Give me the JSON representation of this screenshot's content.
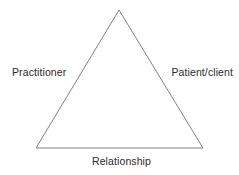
{
  "diagram": {
    "type": "triangle",
    "title": "",
    "background_color": "#ffffff",
    "stroke_color": "#808080",
    "stroke_width": 1,
    "text_color": "#2b2b2b",
    "vertices": {
      "apex": {
        "x": 119,
        "y": 10
      },
      "bottom_left": {
        "x": 36,
        "y": 148
      },
      "bottom_right": {
        "x": 203,
        "y": 148
      }
    },
    "labels": {
      "left": "Practitioner",
      "right": "Patient/client",
      "bottom": "Relationship"
    }
  }
}
